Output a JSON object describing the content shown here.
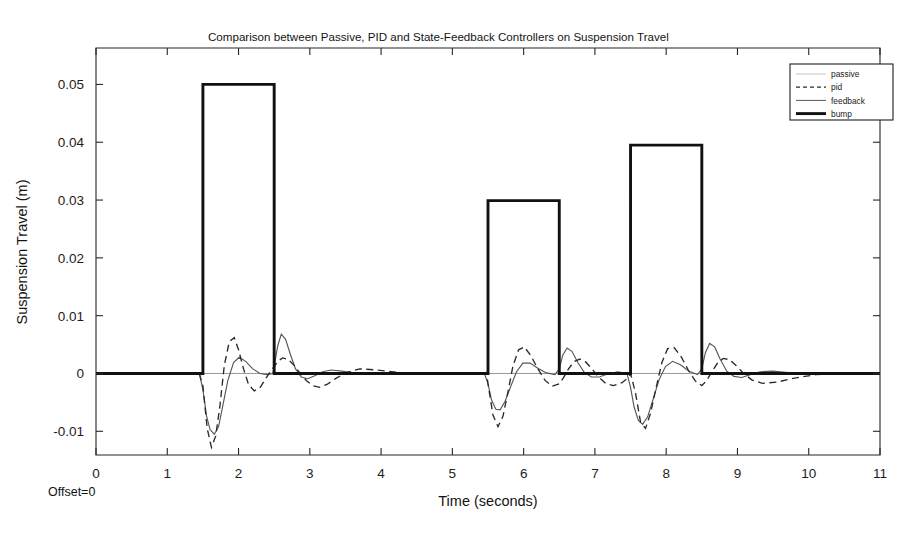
{
  "figure": {
    "title": "Comparison between Passive, PID and State-Feedback Controllers on Suspension Travel",
    "offset_note": "Offset=0",
    "background": "#ffffff"
  },
  "chart_data": {
    "type": "line",
    "title": "Comparison between Passive, PID and State-Feedback Controllers on Suspension Travel",
    "xlabel": "Time (seconds)",
    "ylabel": "Suspension Travel (m)",
    "xlim": [
      0,
      11
    ],
    "ylim": [
      -0.0141,
      0.0563
    ],
    "xticks": [
      0,
      1,
      2,
      3,
      4,
      5,
      6,
      7,
      8,
      9,
      10,
      11
    ],
    "xticklabels": [
      "0",
      "1",
      "2",
      "3",
      "4",
      "5",
      "6",
      "7",
      "8",
      "9",
      "10",
      "11"
    ],
    "yticks": [
      -0.01,
      0,
      0.01,
      0.02,
      0.03,
      0.04,
      0.05
    ],
    "yticklabels": [
      "-0.01",
      "0",
      "0.01",
      "0.02",
      "0.03",
      "0.04",
      "0.05"
    ],
    "grid": false,
    "legend_position": "upper right",
    "legend_entries": [
      "passive",
      "pid",
      "feedback",
      "bump"
    ],
    "colors": {
      "bump": "#111111",
      "pid": "#2a2a2a",
      "feedback": "#575757",
      "passive": "#8d8d8d"
    },
    "linestyles": {
      "bump": "solid-thick",
      "pid": "dashed",
      "feedback": "solid-thin",
      "passive": "solid-hairline"
    },
    "bump_pulses": [
      {
        "t_start": 1.5,
        "t_end": 2.5,
        "amplitude": 0.05
      },
      {
        "t_start": 5.5,
        "t_end": 6.5,
        "amplitude": 0.0299
      },
      {
        "t_start": 7.5,
        "t_end": 8.5,
        "amplitude": 0.0395
      }
    ],
    "series": [
      {
        "name": "bump",
        "x": [
          0,
          1.5,
          1.5,
          2.5,
          2.5,
          5.5,
          5.5,
          6.5,
          6.5,
          7.5,
          7.5,
          8.5,
          8.5,
          11
        ],
        "values": [
          0,
          0,
          0.05,
          0.05,
          0,
          0,
          0.0299,
          0.0299,
          0,
          0,
          0.0395,
          0.0395,
          0,
          0
        ]
      },
      {
        "name": "pid",
        "x": [
          0.0,
          1.45,
          1.5,
          1.56,
          1.62,
          1.68,
          1.74,
          1.8,
          1.87,
          1.94,
          2.0,
          2.07,
          2.14,
          2.22,
          2.3,
          2.38,
          2.46,
          2.5,
          2.56,
          2.62,
          2.7,
          2.78,
          2.86,
          2.95,
          3.04,
          3.14,
          3.24,
          3.36,
          3.5,
          3.7,
          3.95,
          4.3,
          4.8,
          5.3,
          5.48,
          5.5,
          5.57,
          5.64,
          5.71,
          5.78,
          5.85,
          5.93,
          6.01,
          6.1,
          6.2,
          6.3,
          6.4,
          6.5,
          6.56,
          6.63,
          6.71,
          6.79,
          6.87,
          6.96,
          7.05,
          7.15,
          7.26,
          7.38,
          7.48,
          7.5,
          7.57,
          7.64,
          7.71,
          7.78,
          7.86,
          7.94,
          8.02,
          8.11,
          8.21,
          8.31,
          8.41,
          8.5,
          8.57,
          8.64,
          8.72,
          8.8,
          8.89,
          8.98,
          9.08,
          9.2,
          9.35,
          9.55,
          9.8,
          10.1,
          10.5,
          11.0
        ],
        "values": [
          0,
          0,
          -0.0022,
          -0.0095,
          -0.0128,
          -0.0108,
          -0.0055,
          0.0014,
          0.0055,
          0.0062,
          0.0041,
          0.0008,
          -0.0019,
          -0.003,
          -0.0025,
          -0.0009,
          0.0006,
          0.0012,
          0.0022,
          0.0027,
          0.0024,
          0.0014,
          0.0001,
          -0.0012,
          -0.0021,
          -0.0024,
          -0.0019,
          -0.0009,
          0.0001,
          0.0008,
          0.0006,
          0.0001,
          0.0,
          0.0,
          0.0,
          -0.0018,
          -0.0072,
          -0.0092,
          -0.0074,
          -0.0032,
          0.0013,
          0.0041,
          0.0046,
          0.0031,
          0.0008,
          -0.0012,
          -0.0022,
          -0.0018,
          -0.0007,
          0.0008,
          0.0021,
          0.0025,
          0.002,
          0.0008,
          -0.0006,
          -0.0017,
          -0.0021,
          -0.0016,
          -0.0006,
          0.0,
          -0.0034,
          -0.0084,
          -0.0095,
          -0.0069,
          -0.0024,
          0.0019,
          0.0043,
          0.0045,
          0.0029,
          0.0006,
          -0.0013,
          -0.0021,
          -0.0012,
          0.0003,
          0.0018,
          0.0026,
          0.0024,
          0.0014,
          0.0001,
          -0.0011,
          -0.0017,
          -0.0015,
          -0.0008,
          -0.0002,
          0.0,
          0.0
        ]
      },
      {
        "name": "feedback",
        "x": [
          0.0,
          1.45,
          1.5,
          1.55,
          1.6,
          1.66,
          1.72,
          1.78,
          1.85,
          1.93,
          2.01,
          2.1,
          2.2,
          2.3,
          2.4,
          2.48,
          2.5,
          2.55,
          2.6,
          2.66,
          2.73,
          2.8,
          2.88,
          2.97,
          3.07,
          3.18,
          3.3,
          3.45,
          3.62,
          3.85,
          4.15,
          4.6,
          5.1,
          5.45,
          5.5,
          5.55,
          5.61,
          5.67,
          5.74,
          5.82,
          5.9,
          5.99,
          6.09,
          6.2,
          6.32,
          6.44,
          6.5,
          6.55,
          6.61,
          6.68,
          6.76,
          6.85,
          6.95,
          7.06,
          7.18,
          7.32,
          7.45,
          7.5,
          7.55,
          7.61,
          7.67,
          7.74,
          7.82,
          7.9,
          7.99,
          8.09,
          8.2,
          8.32,
          8.44,
          8.5,
          8.55,
          8.61,
          8.68,
          8.76,
          8.85,
          8.95,
          9.06,
          9.18,
          9.32,
          9.5,
          9.75,
          10.1,
          10.5,
          11.0
        ],
        "values": [
          0,
          0,
          -0.0028,
          -0.0073,
          -0.0097,
          -0.0105,
          -0.0092,
          -0.0055,
          -0.0012,
          0.0019,
          0.0028,
          0.0021,
          0.0008,
          0.0,
          -0.0002,
          0.0,
          0.0012,
          0.0048,
          0.0068,
          0.0059,
          0.0032,
          0.0008,
          -0.0006,
          -0.0009,
          -0.0004,
          0.0003,
          0.0006,
          0.0004,
          0.0001,
          0.0,
          0.0,
          0.0,
          0.0,
          0.0,
          -0.0018,
          -0.0046,
          -0.0062,
          -0.0063,
          -0.0048,
          -0.0022,
          0.0003,
          0.0018,
          0.0018,
          0.0009,
          0.0001,
          -0.0002,
          0.0008,
          0.0032,
          0.0044,
          0.0038,
          0.0019,
          0.0002,
          -0.0006,
          -0.0006,
          -0.0001,
          0.0003,
          0.0,
          -0.0024,
          -0.0058,
          -0.0081,
          -0.0088,
          -0.0075,
          -0.0043,
          -0.0011,
          0.0012,
          0.0021,
          0.0015,
          0.0004,
          -0.0002,
          0.0008,
          0.0036,
          0.0052,
          0.0046,
          0.0024,
          0.0004,
          -0.0005,
          -0.0007,
          -0.0002,
          0.0003,
          0.0004,
          0.0001,
          0.0,
          0.0,
          0.0
        ]
      },
      {
        "name": "passive",
        "x": [
          0,
          11
        ],
        "values": [
          0,
          0
        ]
      }
    ]
  }
}
